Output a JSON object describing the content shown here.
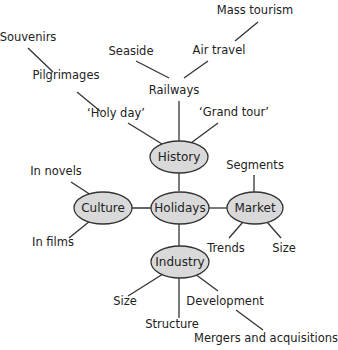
{
  "diagram": {
    "type": "mind-map",
    "center": "Holidays",
    "colors": {
      "node_fill": "#d9d9d9",
      "stroke": "#333333",
      "text": "#222222",
      "background": "#ffffff"
    },
    "nodes": {
      "holidays": "Holidays",
      "history": "History",
      "culture": "Culture",
      "market": "Market",
      "industry": "Industry"
    },
    "labels": {
      "mass_tourism": "Mass tourism",
      "souvenirs": "Souvenirs",
      "seaside": "Seaside",
      "air_travel": "Air travel",
      "pilgrimages": "Pilgrimages",
      "railways": "Railways",
      "holy_day": "‘Holy day’",
      "grand_tour": "‘Grand tour’",
      "segments": "Segments",
      "in_novels": "In novels",
      "in_films": "In films",
      "trends": "Trends",
      "market_size": "Size",
      "industry_size": "Size",
      "development": "Development",
      "structure": "Structure",
      "mergers": "Mergers and acquisitions"
    },
    "edges": [
      [
        "Holidays",
        "History"
      ],
      [
        "Holidays",
        "Culture"
      ],
      [
        "Holidays",
        "Market"
      ],
      [
        "Holidays",
        "Industry"
      ],
      [
        "History",
        "‘Holy day’"
      ],
      [
        "History",
        "Railways"
      ],
      [
        "History",
        "‘Grand tour’"
      ],
      [
        "‘Holy day’",
        "Pilgrimages"
      ],
      [
        "Pilgrimages",
        "Souvenirs"
      ],
      [
        "Railways",
        "Seaside"
      ],
      [
        "Railways",
        "Air travel"
      ],
      [
        "Air travel",
        "Mass tourism"
      ],
      [
        "Culture",
        "In novels"
      ],
      [
        "Culture",
        "In films"
      ],
      [
        "Market",
        "Segments"
      ],
      [
        "Market",
        "Trends"
      ],
      [
        "Market",
        "Size"
      ],
      [
        "Industry",
        "Size"
      ],
      [
        "Industry",
        "Structure"
      ],
      [
        "Industry",
        "Development"
      ],
      [
        "Development",
        "Mergers and acquisitions"
      ]
    ]
  }
}
